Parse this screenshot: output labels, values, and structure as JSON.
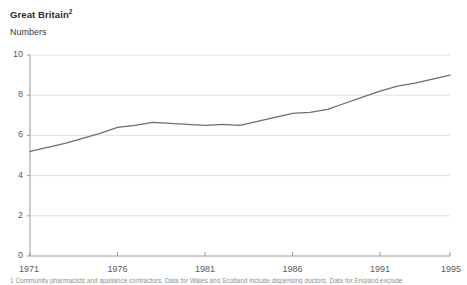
{
  "header": {
    "title": "Great Britain",
    "title_superscript": "2",
    "subtitle": "Numbers"
  },
  "footnote": {
    "text": "1 Community pharmacists and appliance contractors. Data for Wales and Scotland include dispensing doctors. Data for England exclude"
  },
  "chart_data": {
    "type": "line",
    "title": "Great Britain",
    "subtitle": "Numbers",
    "xlabel": "",
    "ylabel": "Numbers",
    "xlim": [
      1971,
      1995
    ],
    "ylim": [
      0,
      10
    ],
    "yticks": [
      0,
      2,
      4,
      6,
      8,
      10
    ],
    "xticks": [
      1971,
      1976,
      1981,
      1986,
      1991,
      1995
    ],
    "ytick_labels": [
      "0",
      "2",
      "4",
      "6",
      "8",
      "10"
    ],
    "xtick_labels": [
      "1971",
      "1976",
      "1981",
      "1986",
      "1991",
      "1995"
    ],
    "grid": "horizontal",
    "legend": "none",
    "line_color": "#6e6e6e",
    "series": [
      {
        "name": "Numbers",
        "x": [
          1971,
          1972,
          1973,
          1974,
          1975,
          1976,
          1977,
          1978,
          1979,
          1980,
          1981,
          1982,
          1983,
          1984,
          1985,
          1986,
          1987,
          1988,
          1989,
          1990,
          1991,
          1992,
          1993,
          1994,
          1995
        ],
        "values": [
          5.2,
          5.4,
          5.6,
          5.85,
          6.1,
          6.4,
          6.5,
          6.65,
          6.6,
          6.55,
          6.5,
          6.55,
          6.5,
          6.7,
          6.9,
          7.1,
          7.15,
          7.3,
          7.6,
          7.9,
          8.2,
          8.45,
          8.6,
          8.8,
          9.0
        ]
      }
    ]
  },
  "geometry": {
    "plot_left": 30,
    "plot_right": 450,
    "plot_top": 55,
    "plot_bottom": 256
  }
}
